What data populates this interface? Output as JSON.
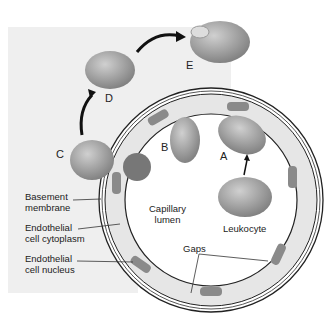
{
  "diagram": {
    "stages": [
      "A",
      "B",
      "C",
      "D",
      "E"
    ],
    "labels": {
      "basement_membrane": "Basement\nmembrane",
      "endothelial_cytoplasm": "Endothelial\ncell cytoplasm",
      "endothelial_nucleus": "Endothelial\ncell nucleus",
      "capillary_lumen": "Capillary\nlumen",
      "leukocyte": "Leukocyte",
      "gaps": "Gaps"
    },
    "colors": {
      "background_panel": "#efefef",
      "cell_fill": "#a9a9a9",
      "endothelium_fill": "#e6e6e6",
      "nucleus_fill": "#8a8a8a",
      "outline": "#1a1a1a"
    }
  }
}
